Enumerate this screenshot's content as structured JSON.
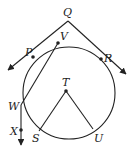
{
  "diagram": {
    "type": "circle-geometry",
    "stroke_color": "#222222",
    "circle": {
      "center": [
        69,
        93
      ],
      "radius": 46
    },
    "points": {
      "Q": {
        "label": "Q",
        "pos": [
          68,
          21
        ],
        "label_pos": [
          63,
          16
        ]
      },
      "P": {
        "label": "P",
        "pos": [
          33,
          57
        ],
        "label_pos": [
          25,
          56
        ]
      },
      "V": {
        "label": "V",
        "pos": [
          58,
          43
        ],
        "label_pos": [
          60,
          40
        ]
      },
      "R": {
        "label": "R",
        "pos": [
          101,
          59
        ],
        "label_pos": [
          104,
          62
        ]
      },
      "T": {
        "label": "T",
        "pos": [
          66,
          91
        ],
        "label_pos": [
          62,
          86
        ]
      },
      "W": {
        "label": "W",
        "pos": [
          21,
          105
        ],
        "label_pos": [
          8,
          110
        ]
      },
      "X": {
        "label": "X",
        "pos": [
          21,
          130
        ],
        "label_pos": [
          10,
          135
        ]
      },
      "S": {
        "label": "S",
        "pos": [
          39,
          131
        ],
        "label_pos": [
          32,
          142
        ]
      },
      "U": {
        "label": "U",
        "pos": [
          93,
          129
        ],
        "label_pos": [
          94,
          142
        ]
      }
    },
    "segments": [
      {
        "name": "ray-QP",
        "from": "Q",
        "to": "P",
        "extends_to": [
          8,
          70
        ],
        "arrow": true
      },
      {
        "name": "ray-QR",
        "from": "Q",
        "to": "R",
        "extends_to": [
          126,
          74
        ],
        "arrow": true
      },
      {
        "name": "segment-VW",
        "from": "V",
        "to": "W"
      },
      {
        "name": "ray-WX",
        "from": "W",
        "to": "X",
        "extends_to": [
          21,
          145
        ],
        "arrow": true
      },
      {
        "name": "segment-TS",
        "from": "T",
        "to": "S"
      },
      {
        "name": "segment-TU",
        "from": "T",
        "to": "U"
      }
    ]
  }
}
